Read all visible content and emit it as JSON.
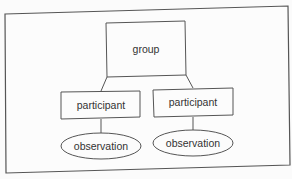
{
  "diagram": {
    "root": {
      "label": "group"
    },
    "children": [
      {
        "label": "participant",
        "child": {
          "label": "observation"
        }
      },
      {
        "label": "participant",
        "child": {
          "label": "observation"
        }
      }
    ]
  }
}
